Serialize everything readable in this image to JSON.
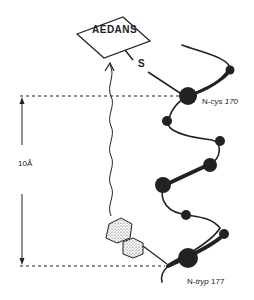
{
  "figure": {
    "fluorophore_label": "AEDANS",
    "linker_label": "S",
    "residue_top": {
      "prefix": "N-",
      "name": "cys",
      "number": "170"
    },
    "residue_bottom": {
      "prefix": "N-",
      "name": "tryp",
      "number": "177"
    },
    "distance_label": "10Å"
  },
  "colors": {
    "ink": "#222222",
    "background": "#ffffff"
  }
}
